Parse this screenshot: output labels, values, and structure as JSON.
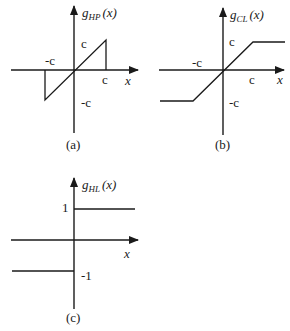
{
  "panels": [
    {
      "id": "a",
      "caption": "(a)",
      "function_name": "g",
      "subscript": "HP",
      "argument": "(x)",
      "x_axis_label": "x",
      "labels": {
        "pos_y": "c",
        "neg_x": "-c",
        "pos_x": "c",
        "neg_y": "-c"
      },
      "description": "sawtooth: linear through origin from -c to c, returns to 0 outside"
    },
    {
      "id": "b",
      "caption": "(b)",
      "function_name": "g",
      "subscript": "CL",
      "argument": "(x)",
      "x_axis_label": "x",
      "labels": {
        "pos_y": "c",
        "neg_x": "-c",
        "pos_x": "c",
        "neg_y": "-c"
      },
      "description": "clipping: linear between -c and c, saturates at ±c"
    },
    {
      "id": "c",
      "caption": "(c)",
      "function_name": "g",
      "subscript": "HL",
      "argument": "(x)",
      "x_axis_label": "x",
      "labels": {
        "pos_y": "1",
        "neg_y": "-1"
      },
      "description": "hard limiter: sign function, +1 for x>0, -1 for x<0"
    }
  ],
  "colors": {
    "ink": "#1a1a1a",
    "background": "#ffffff"
  }
}
